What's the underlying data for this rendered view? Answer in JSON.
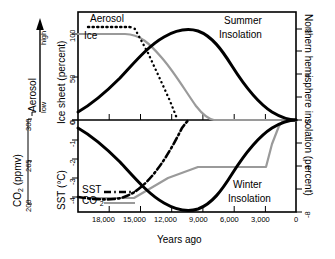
{
  "figure": {
    "xlabel": "Years ago",
    "x_ticks": [
      "18,000",
      "15,000",
      "12,000",
      "9,000",
      "6,000",
      "3,000",
      "0"
    ],
    "annotations": {
      "summer": "Summer",
      "summer2": "Insolation",
      "winter": "Winter",
      "winter2": "Insolation",
      "aerosol_legend": "Aerosol",
      "ice_legend": "Ice",
      "sst_legend": "SST",
      "co2_legend": "CO2",
      "co2_sub": "2"
    },
    "axes": {
      "aerosol": {
        "name": "Aerosol",
        "low": "low",
        "high": "high"
      },
      "ice": {
        "name": "Ice sheet (percent)",
        "ticks": [
          "100",
          "50",
          "0"
        ]
      },
      "co2": {
        "name": "CO",
        "name_sub": "2",
        "name_unit": " (ppmv)",
        "ticks": [
          "300",
          "265",
          "200"
        ]
      },
      "sst": {
        "name": "SST (°C)",
        "ticks": [
          "0",
          "-1",
          "-2",
          "-3",
          "-4"
        ]
      },
      "insolation": {
        "name": "Northern hemisphere insolation (percent)",
        "ticks": [
          "8",
          "4",
          "0",
          "-4",
          "-8"
        ]
      }
    }
  },
  "chart_data": {
    "type": "line",
    "title": "",
    "xlabel": "Years ago",
    "x_reversed": true,
    "xlim": [
      19500,
      0
    ],
    "grid": false,
    "legend": "inline-labels",
    "panels": [
      {
        "name": "upper",
        "ylabel_left": "Ice sheet (percent)",
        "ylim_left": [
          0,
          115
        ],
        "ylabel_right": "Northern hemisphere insolation (percent)",
        "ylim_right": [
          0,
          9.2
        ],
        "series": [
          {
            "name": "Summer Insolation",
            "style": "solid-black-thick",
            "axis": "right",
            "points": [
              [
                19500,
                0.35
              ],
              [
                18000,
                1.1
              ],
              [
                16500,
                2.1
              ],
              [
                15000,
                3.3
              ],
              [
                13500,
                4.8
              ],
              [
                12000,
                6.3
              ],
              [
                10500,
                7.6
              ],
              [
                9500,
                8.2
              ],
              [
                9000,
                8.35
              ],
              [
                8500,
                8.3
              ],
              [
                7500,
                7.9
              ],
              [
                6000,
                6.8
              ],
              [
                4500,
                5.2
              ],
              [
                3000,
                3.4
              ],
              [
                1500,
                1.6
              ],
              [
                0,
                0
              ]
            ]
          },
          {
            "name": "Ice",
            "style": "solid-gray",
            "axis": "left",
            "points": [
              [
                19500,
                100
              ],
              [
                15000,
                100
              ],
              [
                13500,
                92
              ],
              [
                12000,
                78
              ],
              [
                10500,
                62
              ],
              [
                9000,
                44
              ],
              [
                7500,
                26
              ],
              [
                6500,
                12
              ],
              [
                6000,
                5
              ],
              [
                5500,
                1
              ],
              [
                5000,
                0
              ],
              [
                0,
                0
              ]
            ]
          },
          {
            "name": "Aerosol",
            "style": "dotted-black",
            "axis": "left",
            "points": [
              [
                19500,
                108
              ],
              [
                16000,
                108
              ],
              [
                15000,
                107
              ],
              [
                14000,
                92
              ],
              [
                13000,
                74
              ],
              [
                12000,
                54
              ],
              [
                11000,
                34
              ],
              [
                10200,
                14
              ],
              [
                9800,
                0
              ]
            ]
          }
        ]
      },
      {
        "name": "lower",
        "ylabel_left": "SST (°C)",
        "ylim_left": [
          -5.1,
          0.1
        ],
        "ylabel_left2": "CO2 (ppmv)",
        "ylim_left2": [
          200,
          300
        ],
        "ylabel_right": "Northern hemisphere insolation (percent)",
        "ylim_right": [
          -9.2,
          0
        ],
        "series": [
          {
            "name": "Winter Insolation",
            "style": "solid-black-thick",
            "axis": "right",
            "points": [
              [
                19500,
                -0.35
              ],
              [
                18000,
                -1.1
              ],
              [
                16500,
                -2.1
              ],
              [
                15000,
                -3.3
              ],
              [
                13500,
                -4.8
              ],
              [
                12000,
                -6.3
              ],
              [
                10500,
                -7.6
              ],
              [
                9500,
                -8.2
              ],
              [
                9000,
                -8.35
              ],
              [
                8500,
                -8.3
              ],
              [
                7500,
                -7.9
              ],
              [
                6000,
                -6.8
              ],
              [
                4500,
                -5.2
              ],
              [
                3000,
                -3.4
              ],
              [
                1500,
                -1.6
              ],
              [
                0,
                0
              ]
            ]
          },
          {
            "name": "SST",
            "style": "dash-dot-black",
            "axis": "left",
            "points": [
              [
                19500,
                -4.2
              ],
              [
                17500,
                -4.3
              ],
              [
                15500,
                -4.3
              ],
              [
                14500,
                -4.1
              ],
              [
                13500,
                -3.7
              ],
              [
                12500,
                -3.1
              ],
              [
                11500,
                -2.3
              ],
              [
                10500,
                -1.4
              ],
              [
                9800,
                -0.7
              ],
              [
                9300,
                -0.2
              ],
              [
                9000,
                0
              ]
            ]
          },
          {
            "name": "CO2",
            "style": "solid-gray",
            "axis": "left2",
            "points": [
              [
                19500,
                200
              ],
              [
                15000,
                200
              ],
              [
                13500,
                212
              ],
              [
                12000,
                224
              ],
              [
                10500,
                237
              ],
              [
                9500,
                247
              ],
              [
                9000,
                252
              ],
              [
                3000,
                252
              ],
              [
                1800,
                252
              ],
              [
                1500,
                268
              ],
              [
                1200,
                290
              ],
              [
                900,
                300
              ],
              [
                0,
                300
              ]
            ]
          }
        ]
      }
    ]
  }
}
